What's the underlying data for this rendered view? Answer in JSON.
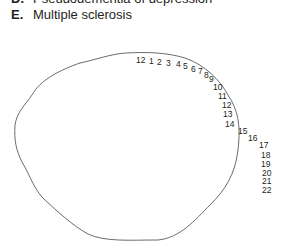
{
  "options": [
    {
      "letter": "D.",
      "text": "Pseudodementia of depression"
    },
    {
      "letter": "E.",
      "text": "Multiple sclerosis"
    }
  ],
  "figure": {
    "numbers": [
      {
        "label": "12",
        "x": 136,
        "y": 63
      },
      {
        "label": "1",
        "x": 149,
        "y": 64
      },
      {
        "label": "2",
        "x": 157,
        "y": 65
      },
      {
        "label": "3",
        "x": 166,
        "y": 66
      },
      {
        "label": "4",
        "x": 176,
        "y": 67
      },
      {
        "label": "5",
        "x": 183,
        "y": 69
      },
      {
        "label": "6",
        "x": 191,
        "y": 72
      },
      {
        "label": "7",
        "x": 198,
        "y": 74
      },
      {
        "label": "8",
        "x": 204,
        "y": 78
      },
      {
        "label": "9",
        "x": 209,
        "y": 82
      },
      {
        "label": "10",
        "x": 213,
        "y": 90
      },
      {
        "label": "11",
        "x": 218,
        "y": 99
      },
      {
        "label": "12",
        "x": 222,
        "y": 108
      },
      {
        "label": "13",
        "x": 223,
        "y": 117
      },
      {
        "label": "14",
        "x": 225,
        "y": 127
      },
      {
        "label": "15",
        "x": 238,
        "y": 134
      },
      {
        "label": "16",
        "x": 248,
        "y": 141
      },
      {
        "label": "17",
        "x": 259,
        "y": 148
      },
      {
        "label": "18",
        "x": 261,
        "y": 158
      },
      {
        "label": "19",
        "x": 261,
        "y": 167
      },
      {
        "label": "20",
        "x": 262,
        "y": 176
      },
      {
        "label": "21",
        "x": 262,
        "y": 184
      },
      {
        "label": "22",
        "x": 262,
        "y": 193
      }
    ]
  }
}
